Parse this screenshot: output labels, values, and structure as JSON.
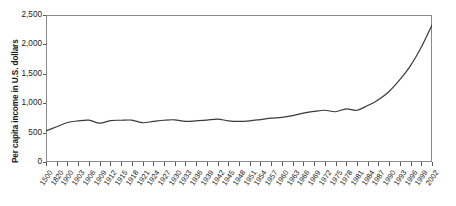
{
  "chart_data": {
    "type": "line",
    "title": "",
    "xlabel": "",
    "ylabel": "Per capita income in U.S. dollars",
    "ylim": [
      0,
      2500
    ],
    "ytick_labels": [
      "2,500",
      "2,000",
      "1,500",
      "1,000",
      "500",
      "0"
    ],
    "ytick_values": [
      2500,
      2000,
      1500,
      1000,
      500,
      0
    ],
    "grid": false,
    "legend": null,
    "legend_position": "none",
    "xlim_index": [
      0,
      36
    ],
    "categories": [
      "1500",
      "1820",
      "1900",
      "1903",
      "1906",
      "1909",
      "1912",
      "1915",
      "1918",
      "1921",
      "1924",
      "1927",
      "1930",
      "1933",
      "1936",
      "1939",
      "1942",
      "1945",
      "1948",
      "1951",
      "1954",
      "1957",
      "1960",
      "1963",
      "1966",
      "1969",
      "1972",
      "1975",
      "1978",
      "1981",
      "1984",
      "1987",
      "1990",
      "1993",
      "1996",
      "1999",
      "2002"
    ],
    "series": [
      {
        "name": "Per capita income",
        "values": [
          530,
          600,
          672,
          700,
          712,
          660,
          705,
          710,
          712,
          668,
          690,
          710,
          718,
          690,
          700,
          712,
          730,
          700,
          690,
          700,
          722,
          745,
          760,
          790,
          830,
          860,
          880,
          855,
          905,
          880,
          960,
          1060,
          1200,
          1400,
          1640,
          1950,
          2330
        ]
      }
    ],
    "line_color": "#3a3a3a",
    "axis_color": "#8a8a8a",
    "background_color": "#ffffff"
  }
}
